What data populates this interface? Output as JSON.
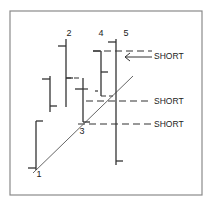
{
  "colors": {
    "background": "#ffffff",
    "frame": "#8a8a8a",
    "ink": "#333333",
    "trend": "#555555"
  },
  "frame": {
    "x": 10,
    "y": 11,
    "w": 192,
    "h": 184
  },
  "chart_data": {
    "type": "bar",
    "subtype": "ohlc-price-bars",
    "title": "",
    "xlabel": "",
    "ylabel": "",
    "grid": false,
    "bars": [
      {
        "label": "1",
        "x": 36,
        "high": 121,
        "low": 170,
        "open": 168,
        "close": 121,
        "label_x": 39,
        "label_y": 177
      },
      {
        "label": "",
        "x": 50,
        "high": 76,
        "low": 112,
        "open": 79,
        "close": 106
      },
      {
        "label": "2",
        "x": 66,
        "high": 39,
        "low": 107,
        "open": 46,
        "close": 78,
        "label_x": 69,
        "label_y": 36
      },
      {
        "label": "3",
        "x": 83,
        "high": 78,
        "low": 122,
        "open": 89,
        "close": 122,
        "label_x": 82,
        "label_y": 134
      },
      {
        "label": "4",
        "x": 101,
        "high": 51,
        "low": 96,
        "open": 51,
        "close": 72,
        "label_x": 101,
        "label_y": 36
      },
      {
        "label": "5",
        "x": 116,
        "high": 39,
        "low": 165,
        "open": 42,
        "close": 161,
        "label_x": 126,
        "label_y": 36
      }
    ],
    "trendline": {
      "x1": 33,
      "y1": 173,
      "x2": 133,
      "y2": 76
    },
    "short_levels": [
      {
        "label": "SHORT",
        "y": 51,
        "x_start": 93,
        "x_end": 152,
        "text_x": 154,
        "text_y": 59,
        "arrow": {
          "y": 57,
          "x_from": 152,
          "x_to": 125
        }
      },
      {
        "label": "SHORT",
        "y": 101,
        "x_start": 86,
        "x_end": 152,
        "text_x": 154,
        "text_y": 104
      },
      {
        "label": "SHORT",
        "y": 124,
        "x_start": 78,
        "x_end": 152,
        "text_x": 154,
        "text_y": 127
      }
    ],
    "extra_dashes": [
      {
        "x1": 66,
        "y1": 78,
        "x2": 82,
        "y2": 78
      },
      {
        "x1": 83,
        "y1": 89,
        "x2": 89,
        "y2": 89
      },
      {
        "x1": 95,
        "y1": 91,
        "x2": 98,
        "y2": 91
      },
      {
        "x1": 101,
        "y1": 96,
        "x2": 113,
        "y2": 96
      }
    ],
    "annotations": [
      "1",
      "2",
      "3",
      "4",
      "5",
      "SHORT",
      "SHORT",
      "SHORT"
    ]
  }
}
